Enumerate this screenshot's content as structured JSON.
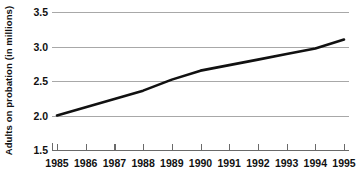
{
  "chart_data": {
    "type": "line",
    "title": "",
    "xlabel": "",
    "ylabel": "Adults on probation (in millions)",
    "xlim": [
      1985,
      1995
    ],
    "ylim": [
      1.5,
      3.5
    ],
    "grid": true,
    "legend": "none",
    "x_tick_labels": [
      "1985",
      "1986",
      "1987",
      "1988",
      "1989",
      "1990",
      "1991",
      "1992",
      "1993",
      "1994",
      "1995"
    ],
    "y_tick_labels": [
      "1.5",
      "2.0",
      "2.5",
      "3.0",
      "3.5"
    ],
    "y_ticks": [
      1.5,
      2.0,
      2.5,
      3.0,
      3.5
    ],
    "x": [
      1985,
      1986,
      1987,
      1988,
      1989,
      1990,
      1991,
      1992,
      1993,
      1994,
      1995
    ],
    "series": [
      {
        "name": "Adults on probation",
        "color": "#111111",
        "values": [
          2.0,
          2.12,
          2.24,
          2.36,
          2.52,
          2.65,
          2.73,
          2.81,
          2.89,
          2.97,
          3.1
        ]
      }
    ]
  },
  "axes": {
    "y_label": "Adults on probation (in millions)",
    "y_ticks": [
      {
        "label": "3.5",
        "value": 3.5
      },
      {
        "label": "3.0",
        "value": 3.0
      },
      {
        "label": "2.5",
        "value": 2.5
      },
      {
        "label": "2.0",
        "value": 2.0
      },
      {
        "label": "1.5",
        "value": 1.5
      }
    ],
    "x_ticks": [
      {
        "label": "1985",
        "value": 1985
      },
      {
        "label": "1986",
        "value": 1986
      },
      {
        "label": "1987",
        "value": 1987
      },
      {
        "label": "1988",
        "value": 1988
      },
      {
        "label": "1989",
        "value": 1989
      },
      {
        "label": "1990",
        "value": 1990
      },
      {
        "label": "1991",
        "value": 1991
      },
      {
        "label": "1992",
        "value": 1992
      },
      {
        "label": "1993",
        "value": 1993
      },
      {
        "label": "1994",
        "value": 1994
      },
      {
        "label": "1995",
        "value": 1995
      }
    ]
  },
  "style": {
    "gridline_color": "#a8a8a8",
    "axis_color": "#6a6a6a",
    "line_color": "#111111",
    "background": "#ffffff"
  }
}
